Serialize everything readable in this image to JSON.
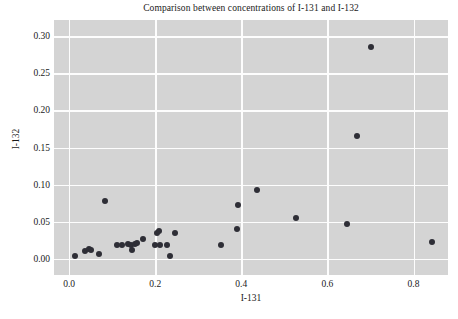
{
  "chart_data": {
    "type": "scatter",
    "title": "Comparison between concentrations of I-131 and I-132",
    "xlabel": "I-131",
    "ylabel": "I-132",
    "xlim": [
      -0.035,
      0.88
    ],
    "ylim": [
      -0.022,
      0.322
    ],
    "xticks": [
      "0.0",
      "0.2",
      "0.4",
      "0.6",
      "0.8"
    ],
    "xtick_values": [
      0.0,
      0.2,
      0.4,
      0.6,
      0.8
    ],
    "yticks": [
      "0.00",
      "0.05",
      "0.10",
      "0.15",
      "0.20",
      "0.25",
      "0.30"
    ],
    "ytick_values": [
      0.0,
      0.05,
      0.1,
      0.15,
      0.2,
      0.25,
      0.3
    ],
    "grid": true,
    "legend": false,
    "marker_color": "#2e2e36",
    "plot_background": "#d4d4d4",
    "gridline_color": "#fdfdfd",
    "points": [
      {
        "x": 0.013,
        "y": 0.003
      },
      {
        "x": 0.037,
        "y": 0.011
      },
      {
        "x": 0.046,
        "y": 0.013
      },
      {
        "x": 0.052,
        "y": 0.012
      },
      {
        "x": 0.07,
        "y": 0.006
      },
      {
        "x": 0.083,
        "y": 0.078
      },
      {
        "x": 0.112,
        "y": 0.018
      },
      {
        "x": 0.122,
        "y": 0.018
      },
      {
        "x": 0.137,
        "y": 0.02
      },
      {
        "x": 0.143,
        "y": 0.019
      },
      {
        "x": 0.147,
        "y": 0.012
      },
      {
        "x": 0.152,
        "y": 0.02
      },
      {
        "x": 0.158,
        "y": 0.021
      },
      {
        "x": 0.172,
        "y": 0.027
      },
      {
        "x": 0.199,
        "y": 0.018
      },
      {
        "x": 0.205,
        "y": 0.034
      },
      {
        "x": 0.21,
        "y": 0.038
      },
      {
        "x": 0.212,
        "y": 0.018
      },
      {
        "x": 0.228,
        "y": 0.019
      },
      {
        "x": 0.235,
        "y": 0.004
      },
      {
        "x": 0.246,
        "y": 0.034
      },
      {
        "x": 0.352,
        "y": 0.018
      },
      {
        "x": 0.39,
        "y": 0.04
      },
      {
        "x": 0.392,
        "y": 0.073
      },
      {
        "x": 0.437,
        "y": 0.092
      },
      {
        "x": 0.527,
        "y": 0.055
      },
      {
        "x": 0.646,
        "y": 0.047
      },
      {
        "x": 0.668,
        "y": 0.166
      },
      {
        "x": 0.701,
        "y": 0.285
      },
      {
        "x": 0.842,
        "y": 0.022
      }
    ]
  }
}
